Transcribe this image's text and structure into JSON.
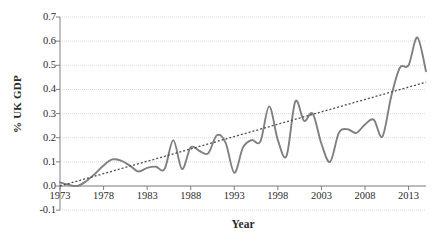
{
  "chart_data": {
    "type": "line",
    "title": "",
    "xlabel": "Year",
    "ylabel": "% UK GDP",
    "xlim": [
      1973,
      2015
    ],
    "ylim": [
      -0.1,
      0.7
    ],
    "ytick_labels": [
      "0.7",
      "0.6",
      "0.5",
      "0.4",
      "0.3",
      "0.2",
      "0.1",
      "0.0",
      "-0.1"
    ],
    "ytick_values": [
      0.7,
      0.6,
      0.5,
      0.4,
      0.3,
      0.2,
      0.1,
      0.0,
      -0.1
    ],
    "xtick_labels": [
      "1973",
      "1978",
      "1983",
      "1988",
      "1993",
      "1998",
      "2003",
      "2008",
      "2013"
    ],
    "xtick_values": [
      1973,
      1978,
      1983,
      1988,
      1993,
      1998,
      2003,
      2008,
      2013
    ],
    "grid": true,
    "legend": false,
    "series": [
      {
        "name": "% UK GDP",
        "style": "solid",
        "color": "#808080",
        "x": [
          1973,
          1974,
          1975,
          1976,
          1977,
          1978,
          1979,
          1980,
          1981,
          1982,
          1983,
          1984,
          1985,
          1986,
          1987,
          1988,
          1989,
          1990,
          1991,
          1992,
          1993,
          1994,
          1995,
          1996,
          1997,
          1998,
          1999,
          2000,
          2001,
          2002,
          2003,
          2004,
          2005,
          2006,
          2007,
          2008,
          2009,
          2010,
          2011,
          2012,
          2013,
          2014,
          2015
        ],
        "values": [
          0.015,
          0.005,
          0.0,
          0.02,
          0.05,
          0.085,
          0.11,
          0.105,
          0.085,
          0.06,
          0.075,
          0.08,
          0.07,
          0.19,
          0.07,
          0.16,
          0.145,
          0.135,
          0.21,
          0.18,
          0.055,
          0.16,
          0.19,
          0.185,
          0.33,
          0.19,
          0.125,
          0.35,
          0.27,
          0.3,
          0.175,
          0.1,
          0.22,
          0.235,
          0.22,
          0.255,
          0.275,
          0.205,
          0.37,
          0.49,
          0.5,
          0.615,
          0.475
        ]
      },
      {
        "name": "Linear trend",
        "style": "dotted",
        "color": "#4d4d4d",
        "x": [
          1973,
          2015
        ],
        "values": [
          0.0,
          0.43
        ]
      }
    ]
  },
  "axis": {
    "y_title": "% UK GDP",
    "x_title": "Year"
  }
}
